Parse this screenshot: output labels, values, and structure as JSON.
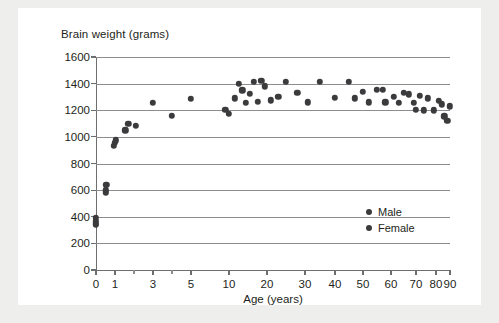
{
  "chart_data": {
    "type": "scatter",
    "title": "",
    "ylabel": "Brain weight (grams)",
    "xlabel": "Age (years)",
    "ylim": [
      0,
      1600
    ],
    "yticks": [
      0,
      200,
      400,
      600,
      800,
      1000,
      1200,
      1400,
      1600
    ],
    "ytick_labels": [
      "0",
      "200",
      "400",
      "600",
      "800",
      "1000",
      "1200",
      "1400",
      "1600"
    ],
    "xscale": "piecewise-compressed",
    "xticks": [
      0,
      1,
      3,
      5,
      10,
      20,
      30,
      40,
      50,
      60,
      70,
      80,
      90
    ],
    "xtick_labels": [
      "0",
      "1",
      "3",
      "5",
      "10",
      "20",
      "30",
      "40",
      "50",
      "60",
      "70",
      "80",
      "90"
    ],
    "x_minor_ticks": [
      2,
      4
    ],
    "grid": "horizontal",
    "legend_position": "inside-right",
    "marker_color": "#3b3b3d",
    "legend": [
      {
        "label": "Male",
        "color": "#3b3b3d"
      },
      {
        "label": "Female",
        "color": "#3b3b3d"
      }
    ],
    "points": [
      {
        "age": 0.0,
        "weight": 390
      },
      {
        "age": 0.0,
        "weight": 370
      },
      {
        "age": 0.0,
        "weight": 350
      },
      {
        "age": 0.0,
        "weight": 340
      },
      {
        "age": 0.55,
        "weight": 640
      },
      {
        "age": 0.5,
        "weight": 600
      },
      {
        "age": 0.5,
        "weight": 585
      },
      {
        "age": 1.05,
        "weight": 975
      },
      {
        "age": 1.0,
        "weight": 955
      },
      {
        "age": 0.95,
        "weight": 935
      },
      {
        "age": 1.55,
        "weight": 1050
      },
      {
        "age": 1.7,
        "weight": 1100
      },
      {
        "age": 2.1,
        "weight": 1085
      },
      {
        "age": 3.0,
        "weight": 1255
      },
      {
        "age": 4.0,
        "weight": 1160
      },
      {
        "age": 5.0,
        "weight": 1285
      },
      {
        "age": 9.5,
        "weight": 1205
      },
      {
        "age": 10.0,
        "weight": 1175
      },
      {
        "age": 11.5,
        "weight": 1290
      },
      {
        "age": 12.5,
        "weight": 1400
      },
      {
        "age": 13.5,
        "weight": 1350
      },
      {
        "age": 14.5,
        "weight": 1255
      },
      {
        "age": 15.5,
        "weight": 1325
      },
      {
        "age": 16.5,
        "weight": 1415
      },
      {
        "age": 17.5,
        "weight": 1265
      },
      {
        "age": 18.5,
        "weight": 1420
      },
      {
        "age": 19.5,
        "weight": 1380
      },
      {
        "age": 21.0,
        "weight": 1275
      },
      {
        "age": 23.0,
        "weight": 1300
      },
      {
        "age": 25.0,
        "weight": 1415
      },
      {
        "age": 28.0,
        "weight": 1330
      },
      {
        "age": 31.0,
        "weight": 1260
      },
      {
        "age": 35.0,
        "weight": 1415
      },
      {
        "age": 40.0,
        "weight": 1295
      },
      {
        "age": 45.0,
        "weight": 1415
      },
      {
        "age": 47.0,
        "weight": 1290
      },
      {
        "age": 50.0,
        "weight": 1340
      },
      {
        "age": 52.0,
        "weight": 1260
      },
      {
        "age": 55.0,
        "weight": 1355
      },
      {
        "age": 57.0,
        "weight": 1355
      },
      {
        "age": 58.0,
        "weight": 1260
      },
      {
        "age": 61.0,
        "weight": 1300
      },
      {
        "age": 63.0,
        "weight": 1255
      },
      {
        "age": 65.0,
        "weight": 1330
      },
      {
        "age": 67.0,
        "weight": 1320
      },
      {
        "age": 69.0,
        "weight": 1255
      },
      {
        "age": 70.0,
        "weight": 1205
      },
      {
        "age": 72.0,
        "weight": 1310
      },
      {
        "age": 74.0,
        "weight": 1200
      },
      {
        "age": 76.0,
        "weight": 1290
      },
      {
        "age": 79.0,
        "weight": 1200
      },
      {
        "age": 82.0,
        "weight": 1270
      },
      {
        "age": 84.0,
        "weight": 1245
      },
      {
        "age": 86.0,
        "weight": 1155
      },
      {
        "age": 88.0,
        "weight": 1120
      },
      {
        "age": 90.0,
        "weight": 1230
      }
    ]
  }
}
